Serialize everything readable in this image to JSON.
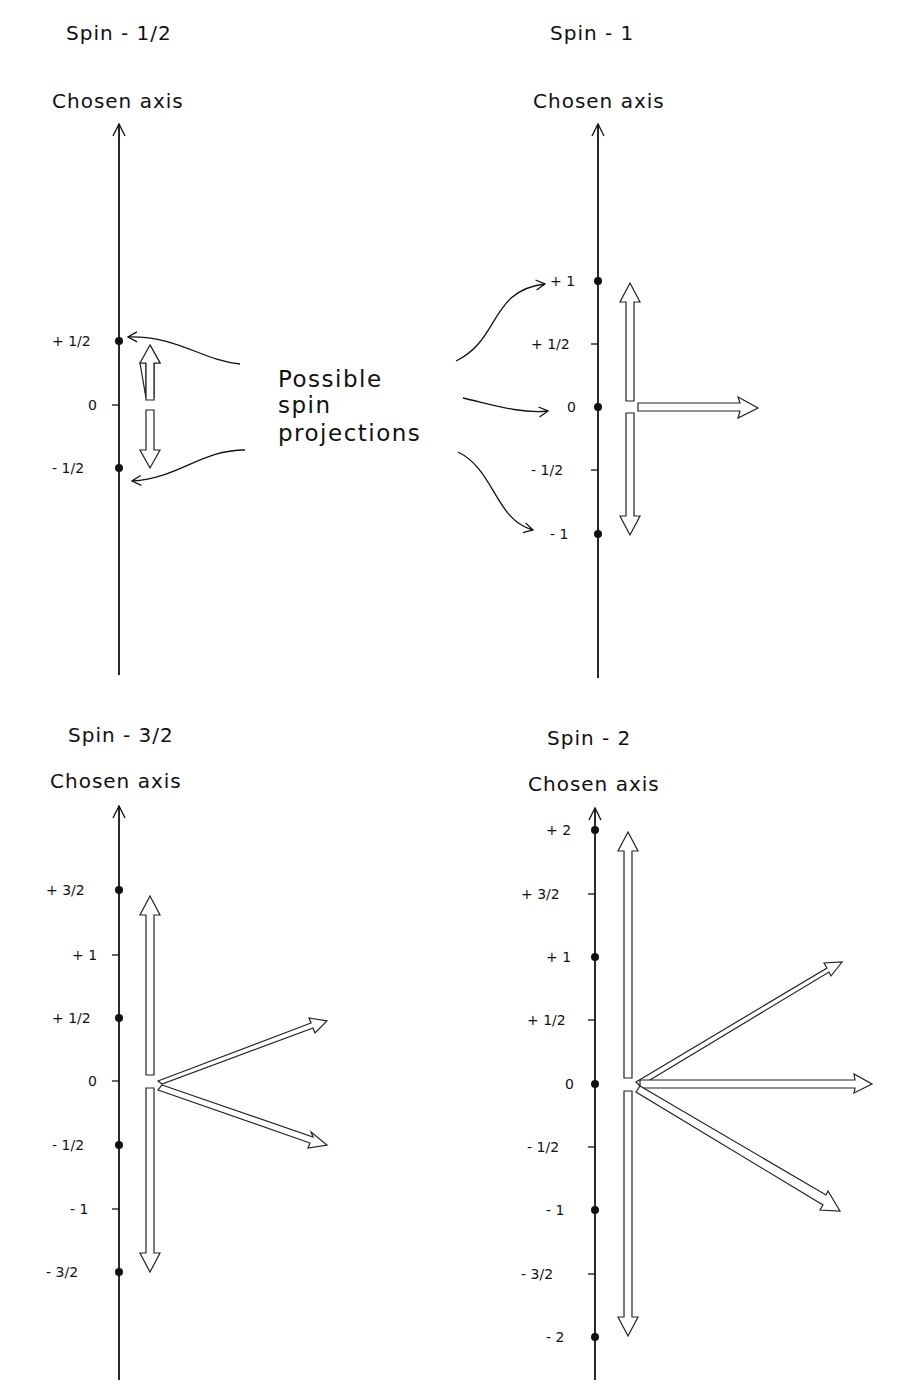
{
  "caption": {
    "line1": "Possible",
    "line2": "spin",
    "line3": "projections"
  },
  "panels": [
    {
      "title": "Spin - 1/2",
      "axis_label": "Chosen axis",
      "ticks": [
        "+ 1/2",
        "0",
        "- 1/2"
      ],
      "allowed": [
        "+ 1/2",
        "- 1/2"
      ]
    },
    {
      "title": "Spin - 1",
      "axis_label": "Chosen axis",
      "ticks": [
        "+ 1",
        "+ 1/2",
        "0",
        "- 1/2",
        "- 1"
      ],
      "allowed": [
        "+ 1",
        "0",
        "- 1"
      ]
    },
    {
      "title": "Spin - 3/2",
      "axis_label": "Chosen axis",
      "ticks": [
        "+ 3/2",
        "+ 1",
        "+ 1/2",
        "0",
        "- 1/2",
        "- 1",
        "- 3/2"
      ],
      "allowed": [
        "+ 3/2",
        "+ 1/2",
        "- 1/2",
        "- 3/2"
      ]
    },
    {
      "title": "Spin - 2",
      "axis_label": "Chosen axis",
      "ticks": [
        "+ 2",
        "+ 3/2",
        "+ 1",
        "+ 1/2",
        "0",
        "- 1/2",
        "- 1",
        "- 3/2",
        "- 2"
      ],
      "allowed": [
        "+ 2",
        "+ 1",
        "0",
        "- 1",
        "- 2"
      ]
    }
  ]
}
